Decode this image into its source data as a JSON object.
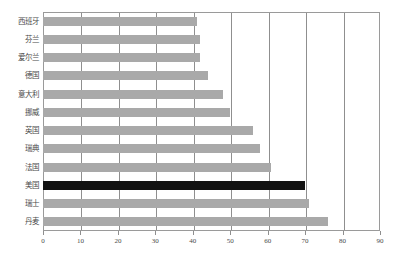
{
  "chart_data": {
    "type": "bar",
    "orientation": "horizontal",
    "title": "",
    "xlabel": "",
    "ylabel": "",
    "categories": [
      "西班牙",
      "芬兰",
      "爱尔兰",
      "德国",
      "意大利",
      "挪威",
      "英国",
      "瑞典",
      "法国",
      "美国",
      "瑞士",
      "丹麦"
    ],
    "values": [
      41,
      42,
      42,
      44,
      48,
      50,
      56,
      58,
      61,
      70,
      71,
      76
    ],
    "highlight_category": "美国",
    "xlim": [
      0,
      90
    ],
    "xticks": [
      0,
      10,
      20,
      30,
      40,
      50,
      60,
      70,
      80,
      90
    ],
    "xtick_labels": [
      "0",
      "10",
      "20",
      "30",
      "40",
      "50",
      "60",
      "70",
      "80",
      "90"
    ],
    "grid": "vertical",
    "gridlines": [
      10,
      20,
      30,
      40,
      50,
      60,
      70,
      80
    ],
    "legend": "none",
    "colors": {
      "bar": "#a9a9a9",
      "highlight_bar": "#121212",
      "axis": "#8f8f8f",
      "grid": "#8f8f8f",
      "text": "#4a4a4a",
      "background": "#ffffff"
    }
  }
}
